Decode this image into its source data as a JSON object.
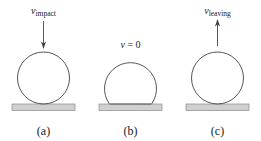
{
  "figure": {
    "background_color": "#ffffff",
    "stroke_color": "#444444",
    "ground_fill": "#d0d0d0",
    "ground_stroke": "#8a8a8a",
    "text_color": "#1a1a1a"
  },
  "panels": [
    {
      "id": "a",
      "caption": "(a)",
      "velocity_symbol": "v",
      "velocity_subscript": "impact",
      "velocity_equals": "",
      "arrow_direction": "down",
      "ball_state": "round",
      "has_dashed_line": false
    },
    {
      "id": "b",
      "caption": "(b)",
      "velocity_symbol": "v",
      "velocity_subscript": "",
      "velocity_equals": " = 0",
      "arrow_direction": "none",
      "ball_state": "flattened",
      "has_dashed_line": true
    },
    {
      "id": "c",
      "caption": "(c)",
      "velocity_symbol": "v",
      "velocity_subscript": "leaving",
      "velocity_equals": "",
      "arrow_direction": "up",
      "ball_state": "round",
      "has_dashed_line": false
    }
  ]
}
